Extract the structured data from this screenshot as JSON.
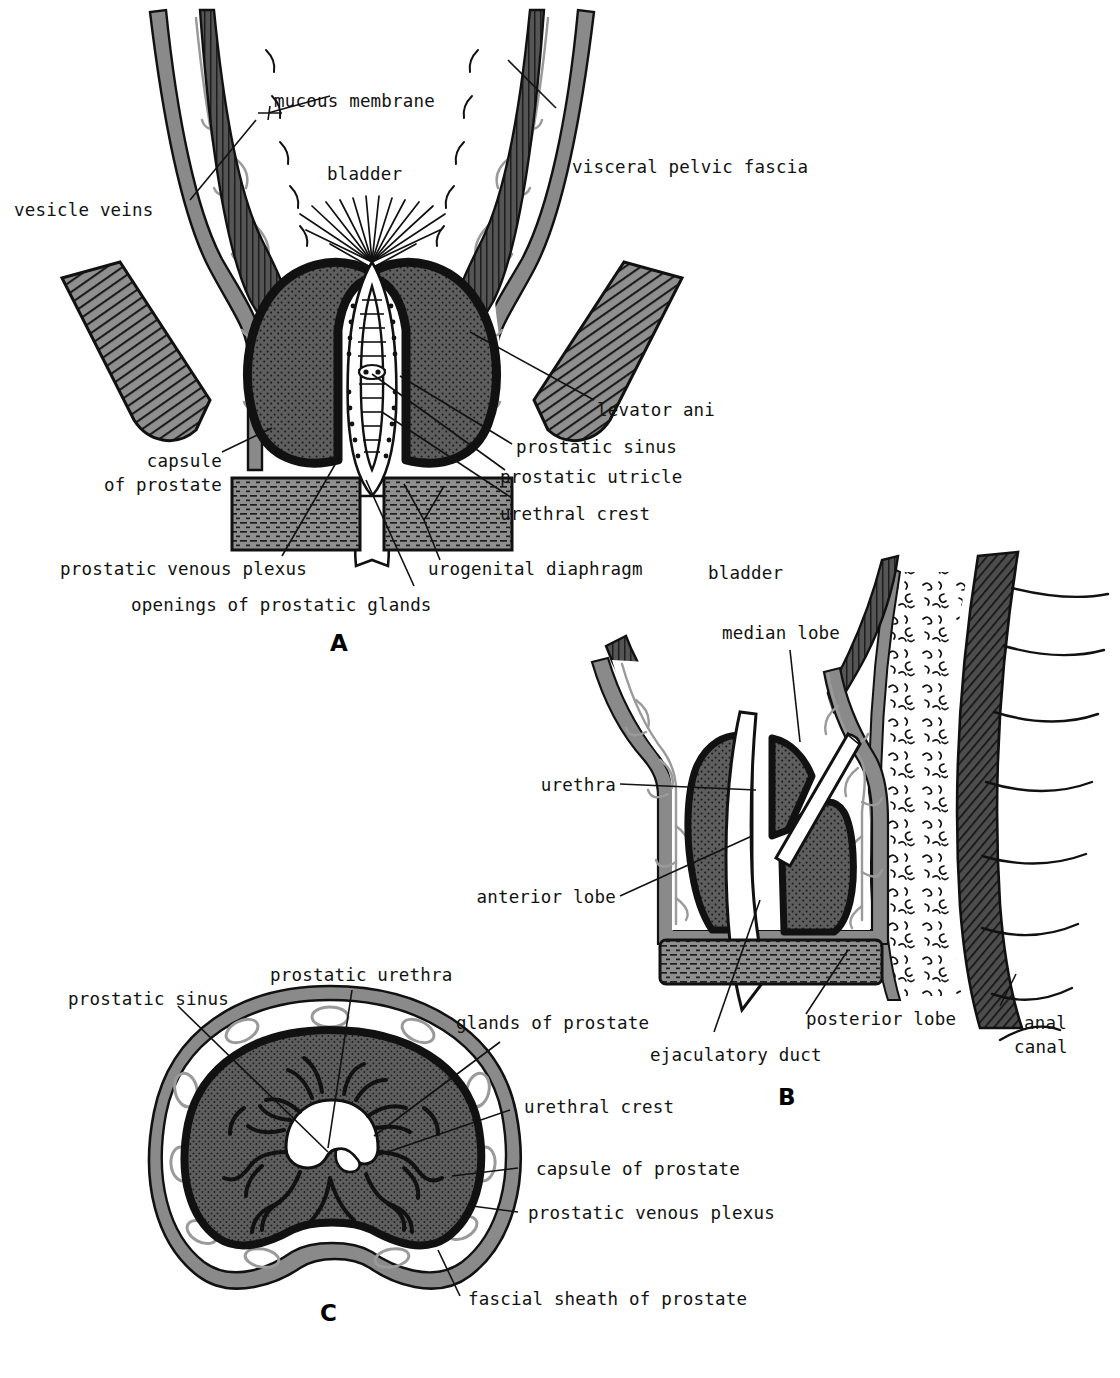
{
  "plate": {
    "title": "Prostate gland: coronal section, sagittal section and transverse section",
    "background": "#ffffff",
    "ink": "#121212"
  },
  "palette": {
    "prostate_fill": "#5e5e5e",
    "prostate_stipple": "#1d1d1d",
    "muscle_gray": "#8f8f8f",
    "bladder_wall": "#4a4a4a",
    "fascia_gray": "#8a8a8a",
    "vein_gray": "#9a9a9a",
    "outline": "#111111",
    "white": "#ffffff"
  },
  "panels": [
    {
      "id": "A",
      "letter": "A",
      "view": "coronal section through bladder neck and prostate",
      "labels": [
        {
          "key": "mucous_membrane",
          "text": "mucous membrane"
        },
        {
          "key": "bladder",
          "text": "bladder"
        },
        {
          "key": "visceral_fascia",
          "text": "visceral pelvic fascia"
        },
        {
          "key": "vesicle_veins",
          "text": "vesicle veins"
        },
        {
          "key": "levator_ani",
          "text": "levator ani"
        },
        {
          "key": "prostatic_sinus",
          "text": "prostatic sinus"
        },
        {
          "key": "prostatic_utricle",
          "text": "prostatic utricle"
        },
        {
          "key": "urethral_crest",
          "text": "urethral crest"
        },
        {
          "key": "capsule_line1",
          "text": "capsule"
        },
        {
          "key": "capsule_line2",
          "text": "of prostate"
        },
        {
          "key": "venous_plexus",
          "text": "prostatic venous plexus"
        },
        {
          "key": "urogenital",
          "text": "urogenital diaphragm"
        },
        {
          "key": "openings",
          "text": "openings of prostatic glands"
        }
      ]
    },
    {
      "id": "B",
      "letter": "B",
      "view": "median sagittal section showing lobes of the prostate",
      "labels": [
        {
          "key": "bladder",
          "text": "bladder"
        },
        {
          "key": "median_lobe",
          "text": "median lobe"
        },
        {
          "key": "urethra",
          "text": "urethra"
        },
        {
          "key": "anterior_lobe",
          "text": "anterior lobe"
        },
        {
          "key": "posterior_lobe",
          "text": "posterior lobe"
        },
        {
          "key": "ejaculatory",
          "text": "ejaculatory duct"
        },
        {
          "key": "anal_line1",
          "text": "anal"
        },
        {
          "key": "anal_line2",
          "text": "canal"
        }
      ]
    },
    {
      "id": "C",
      "letter": "C",
      "view": "transverse section of the prostate",
      "labels": [
        {
          "key": "prostatic_sinus",
          "text": "prostatic sinus"
        },
        {
          "key": "prostatic_urethra",
          "text": "prostatic urethra"
        },
        {
          "key": "glands",
          "text": "glands of prostate"
        },
        {
          "key": "urethral_crest",
          "text": "urethral crest"
        },
        {
          "key": "capsule",
          "text": "capsule of prostate"
        },
        {
          "key": "venous_plexus",
          "text": "prostatic venous plexus"
        },
        {
          "key": "fascial_sheath",
          "text": "fascial sheath of prostate"
        }
      ]
    }
  ]
}
